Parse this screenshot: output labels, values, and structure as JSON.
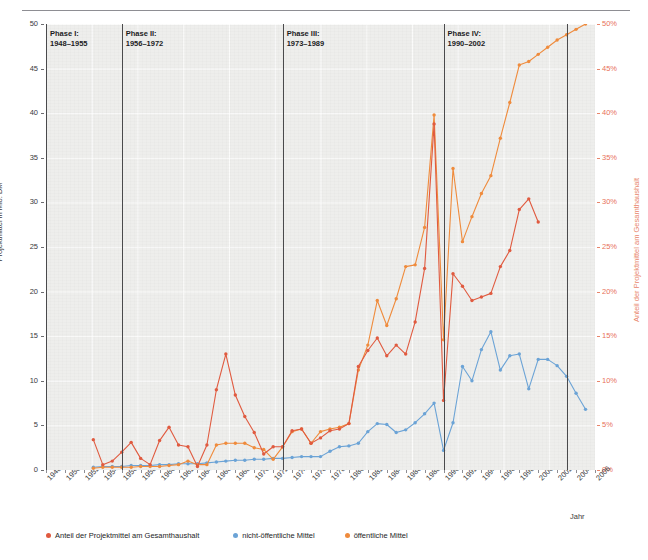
{
  "header": {
    "running_text": ""
  },
  "axes": {
    "y_left": {
      "title": "Projektmittel in Mio. DM",
      "ticks": [
        "0",
        "5",
        "10",
        "15",
        "20",
        "25",
        "30",
        "35",
        "40",
        "45",
        "50"
      ],
      "min": 0,
      "max": 50,
      "step": 5,
      "color": "#3a3a3c"
    },
    "y_right": {
      "title": "Anteil der Projektmittel am Gesamthaushalt",
      "ticks": [
        "0%",
        "5%",
        "10%",
        "15%",
        "20%",
        "25%",
        "30%",
        "35%",
        "40%",
        "45%",
        "50%"
      ],
      "min": 0,
      "max": 50,
      "step": 5,
      "color": "#e8715a"
    },
    "x": {
      "title": "Jahr",
      "ticks": [
        "1948",
        "1950",
        "1952",
        "1954",
        "1956",
        "1958",
        "1960",
        "1962",
        "1964",
        "1966",
        "1968",
        "1970",
        "1972",
        "1974",
        "1976",
        "1978",
        "1980",
        "1982",
        "1984",
        "1986",
        "1988",
        "1990",
        "1992",
        "1994",
        "1996",
        "1998",
        "2000",
        "2002",
        "2004",
        "2006"
      ],
      "min": 1948,
      "max": 2006,
      "color": "#3a3a3c"
    }
  },
  "phases": [
    {
      "name": "Phase I:",
      "range": "1948–1955",
      "start_year": 1948,
      "line_year": 1948
    },
    {
      "name": "Phase II:",
      "range": "1956–1972",
      "start_year": 1956,
      "line_year": 1956
    },
    {
      "name": "Phase III:",
      "range": "1973–1989",
      "start_year": 1973,
      "line_year": 1973
    },
    {
      "name": "Phase IV:",
      "range": "1990–2002",
      "start_year": 1990,
      "line_year": 1990
    },
    {
      "name": "",
      "range": "",
      "start_year": 2003,
      "line_year": 2003
    }
  ],
  "legend": {
    "position": "bottom-left",
    "items": [
      {
        "label": "Anteil der Projektmittel am Gesamthaushalt",
        "color": "#e05a3f"
      },
      {
        "label": "nicht-öffentliche Mittel",
        "color": "#6ba3d6"
      },
      {
        "label": "öffentliche Mittel",
        "color": "#ef8b3c"
      }
    ]
  },
  "chart_data": {
    "type": "line",
    "title": "",
    "subtitle": "",
    "xlabel": "Jahr",
    "ylabel": "Projektmittel in Mio. DM",
    "ylabel_right": "Anteil der Projektmittel am Gesamthaushalt",
    "xlim": [
      1948,
      2006
    ],
    "ylim": [
      0,
      50
    ],
    "ylim_right": [
      0,
      50
    ],
    "grid": true,
    "legend_position": "bottom-left",
    "annotations": [
      {
        "text": "Phase I: 1948–1955",
        "x": 1948
      },
      {
        "text": "Phase II: 1956–1972",
        "x": 1956
      },
      {
        "text": "Phase III: 1973–1989",
        "x": 1973
      },
      {
        "text": "Phase IV: 1990–2002",
        "x": 1990
      }
    ],
    "x": [
      1953,
      1954,
      1955,
      1956,
      1957,
      1958,
      1959,
      1960,
      1961,
      1962,
      1963,
      1964,
      1965,
      1966,
      1967,
      1968,
      1969,
      1970,
      1971,
      1972,
      1973,
      1974,
      1975,
      1976,
      1977,
      1978,
      1979,
      1980,
      1981,
      1982,
      1983,
      1984,
      1985,
      1986,
      1987,
      1988,
      1989,
      1990,
      1991,
      1992,
      1993,
      1994,
      1995,
      1996,
      1997,
      1998,
      1999,
      2000,
      2001,
      2002,
      2003,
      2004,
      2005
    ],
    "series": [
      {
        "name": "Anteil der Projektmittel am Gesamthaushalt",
        "color": "#e05a3f",
        "axis": "right",
        "unit": "%",
        "values": [
          3.4,
          0.6,
          1.0,
          2.0,
          3.1,
          1.3,
          0.6,
          3.3,
          4.8,
          2.8,
          2.6,
          0.4,
          2.8,
          9.0,
          13.0,
          8.4,
          6.0,
          4.2,
          1.8,
          2.6,
          2.6,
          4.4,
          4.6,
          3.0,
          3.6,
          4.4,
          4.6,
          5.2,
          11.6,
          13.4,
          14.8,
          12.8,
          14.0,
          13.0,
          16.6,
          22.6,
          38.8,
          7.8,
          22.0,
          20.6,
          19.0,
          19.4,
          19.8,
          22.8,
          24.6,
          29.2,
          30.4,
          27.8,
          null,
          null,
          null,
          null,
          null
        ]
      },
      {
        "name": "nicht-öffentliche Mittel",
        "color": "#6ba3d6",
        "axis": "left",
        "unit": "Mio. DM",
        "values": [
          0.3,
          0.4,
          0.4,
          0.4,
          0.5,
          0.5,
          0.5,
          0.6,
          0.6,
          0.7,
          0.7,
          0.7,
          0.8,
          0.9,
          1.0,
          1.1,
          1.1,
          1.2,
          1.2,
          1.3,
          1.3,
          1.4,
          1.5,
          1.5,
          1.5,
          2.1,
          2.6,
          2.7,
          3.0,
          4.3,
          5.2,
          5.1,
          4.2,
          4.5,
          5.3,
          6.3,
          7.5,
          2.2,
          5.3,
          11.6,
          10.0,
          13.5,
          15.5,
          11.2,
          12.8,
          13.0,
          9.1,
          12.4,
          12.4,
          11.7,
          10.5,
          8.6,
          6.8
        ]
      },
      {
        "name": "öffentliche Mittel",
        "color": "#ef8b3c",
        "axis": "left",
        "unit": "Mio. DM",
        "values": [
          0.2,
          0.3,
          0.3,
          0.3,
          0.3,
          0.4,
          0.4,
          0.4,
          0.5,
          0.6,
          1.0,
          0.6,
          0.6,
          2.8,
          3.0,
          3.0,
          3.0,
          2.5,
          2.3,
          1.2,
          2.6,
          4.3,
          4.6,
          3.0,
          4.3,
          4.6,
          4.8,
          5.2,
          11.2,
          14.0,
          19.0,
          16.2,
          19.2,
          22.8,
          23.0,
          27.2,
          39.8,
          14.6,
          33.8,
          25.6,
          28.4,
          31.0,
          33.0,
          37.2,
          41.2,
          45.4,
          45.8,
          46.6,
          47.4,
          48.2,
          48.8,
          49.4,
          50.0
        ]
      }
    ]
  }
}
